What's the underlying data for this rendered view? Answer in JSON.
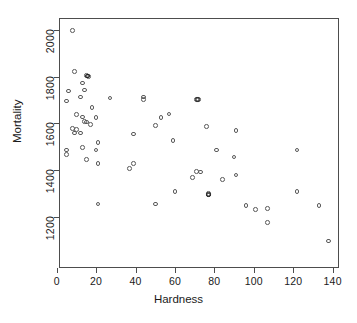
{
  "chart_data": {
    "type": "scatter",
    "title": "",
    "xlabel": "Hardness",
    "ylabel": "Mortality",
    "xlim": [
      -3,
      139
    ],
    "ylim": [
      1080,
      2010
    ],
    "grid": false,
    "legend": null,
    "xticks": [
      0,
      20,
      40,
      60,
      80,
      100,
      120,
      140
    ],
    "yticks": [
      1200,
      1400,
      1600,
      1800,
      2000
    ],
    "xticklabels": [
      "0",
      "20",
      "40",
      "60",
      "80",
      "100",
      "120",
      "140"
    ],
    "yticklabels": [
      "1200",
      "1400",
      "1600",
      "1800",
      "2000"
    ],
    "marker": "open-circle",
    "marker_color": "#595959",
    "n_points": 61,
    "points": [
      {
        "x": 8,
        "y": 1997
      },
      {
        "x": 9,
        "y": 1821
      },
      {
        "x": 15,
        "y": 1804
      },
      {
        "x": 16,
        "y": 1800
      },
      {
        "x": 13,
        "y": 1772
      },
      {
        "x": 14,
        "y": 1742
      },
      {
        "x": 6,
        "y": 1739
      },
      {
        "x": 12,
        "y": 1713
      },
      {
        "x": 27,
        "y": 1709
      },
      {
        "x": 44,
        "y": 1712
      },
      {
        "x": 44,
        "y": 1702
      },
      {
        "x": 71,
        "y": 1702
      },
      {
        "x": 72,
        "y": 1702
      },
      {
        "x": 5,
        "y": 1696
      },
      {
        "x": 18,
        "y": 1668
      },
      {
        "x": 10,
        "y": 1637
      },
      {
        "x": 57,
        "y": 1640
      },
      {
        "x": 53,
        "y": 1625
      },
      {
        "x": 13,
        "y": 1627
      },
      {
        "x": 20,
        "y": 1625
      },
      {
        "x": 14,
        "y": 1609
      },
      {
        "x": 15,
        "y": 1605
      },
      {
        "x": 17,
        "y": 1596
      },
      {
        "x": 50,
        "y": 1591
      },
      {
        "x": 76,
        "y": 1587
      },
      {
        "x": 8,
        "y": 1579
      },
      {
        "x": 10,
        "y": 1574
      },
      {
        "x": 91,
        "y": 1569
      },
      {
        "x": 9,
        "y": 1558
      },
      {
        "x": 12,
        "y": 1558
      },
      {
        "x": 39,
        "y": 1555
      },
      {
        "x": 59,
        "y": 1527
      },
      {
        "x": 21,
        "y": 1519
      },
      {
        "x": 13,
        "y": 1496
      },
      {
        "x": 20,
        "y": 1486
      },
      {
        "x": 5,
        "y": 1485
      },
      {
        "x": 81,
        "y": 1486
      },
      {
        "x": 122,
        "y": 1485
      },
      {
        "x": 5,
        "y": 1466
      },
      {
        "x": 90,
        "y": 1456
      },
      {
        "x": 15,
        "y": 1444
      },
      {
        "x": 39,
        "y": 1427
      },
      {
        "x": 21,
        "y": 1428
      },
      {
        "x": 37,
        "y": 1407
      },
      {
        "x": 71,
        "y": 1393
      },
      {
        "x": 73,
        "y": 1391
      },
      {
        "x": 91,
        "y": 1378
      },
      {
        "x": 69,
        "y": 1369
      },
      {
        "x": 84,
        "y": 1359
      },
      {
        "x": 122,
        "y": 1309
      },
      {
        "x": 60,
        "y": 1307
      },
      {
        "x": 77,
        "y": 1299
      },
      {
        "x": 77,
        "y": 1292
      },
      {
        "x": 21,
        "y": 1254
      },
      {
        "x": 50,
        "y": 1254
      },
      {
        "x": 96,
        "y": 1247
      },
      {
        "x": 133,
        "y": 1247
      },
      {
        "x": 107,
        "y": 1236
      },
      {
        "x": 101,
        "y": 1231
      },
      {
        "x": 107,
        "y": 1175
      },
      {
        "x": 138,
        "y": 1096
      }
    ],
    "overplotted_points": [
      {
        "x": 71.5,
        "y": 1702,
        "note": "two coincident markers"
      },
      {
        "x": 77,
        "y": 1295,
        "note": "two coincident markers"
      },
      {
        "x": 15.5,
        "y": 1802,
        "note": "two coincident markers"
      }
    ]
  }
}
